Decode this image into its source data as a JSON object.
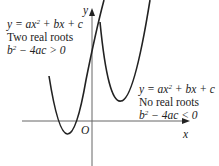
{
  "diagram": {
    "axes": {
      "x_label": "x",
      "y_label": "y",
      "origin_label": "O"
    },
    "left_curve": {
      "equation": "y = ax² + bx + c",
      "eq_parts": [
        "y = ax",
        "2",
        " + bx + c"
      ],
      "description": "Two real roots",
      "discriminant_parts": [
        "b",
        "2",
        " − 4ac > 0"
      ]
    },
    "right_curve": {
      "equation": "y = ax² + bx + c",
      "eq_parts": [
        "y = ax",
        "2",
        " + bx + c"
      ],
      "description": "No real roots",
      "discriminant_parts": [
        "b",
        "2",
        " − 4ac < 0"
      ]
    },
    "colors": {
      "curve": "#222222",
      "axis": "#555555",
      "text": "#222222"
    }
  }
}
